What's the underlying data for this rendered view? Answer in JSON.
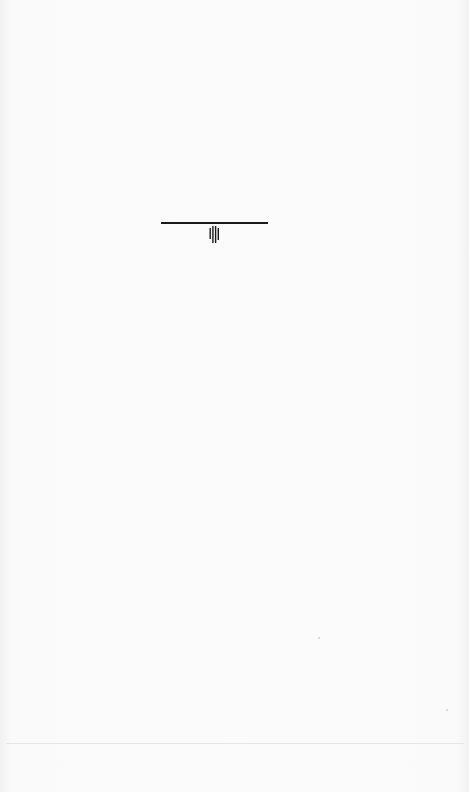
{
  "page": {
    "type": "scanned-document-page",
    "background_color": "#f8f8f8",
    "content_state": "blank page with faint illegible bleed-through from reverse side"
  },
  "ornament": {
    "rule_color": "#1a1a1a",
    "icon": "vertical-bars-ornament-icon"
  },
  "footer": {
    "separator_color": "#e6e6e6"
  }
}
